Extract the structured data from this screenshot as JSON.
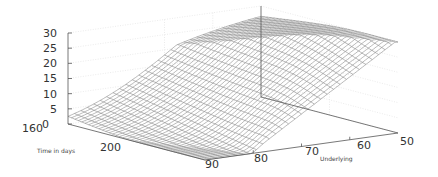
{
  "chart_data": {
    "type": "surface3d",
    "title": "",
    "xlabel": "Time in days",
    "ylabel": "Underlying",
    "zlabel": "",
    "x_range": [
      160,
      240
    ],
    "y_range": [
      90,
      50
    ],
    "z_range": [
      0,
      30
    ],
    "x_ticks": [
      "160",
      "200"
    ],
    "y_ticks": [
      "90",
      "80",
      "70",
      "60",
      "50"
    ],
    "z_ticks": [
      "0",
      "5",
      "10",
      "15",
      "20",
      "25",
      "30"
    ],
    "grid": true,
    "surface_description": "Option-value-like surface: near 0 at high underlying (90), rising toward 30 at low underlying (50); transition steepens into a cliff near underlying 70 as time increases",
    "grid_resolution": {
      "time_lines": 40,
      "underlying_lines": 30
    },
    "line_color": "#8a8a8a"
  }
}
